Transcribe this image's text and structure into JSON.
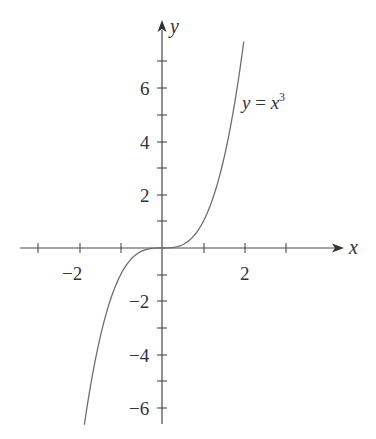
{
  "chart_data": {
    "type": "line",
    "title": "",
    "xlabel": "x",
    "ylabel": "y",
    "function": "y = x^3",
    "series": [
      {
        "name": "y = x^3",
        "x": [
          -1.88,
          -1.5,
          -1.0,
          -0.5,
          0,
          0.5,
          1.0,
          1.5,
          1.98
        ],
        "values": [
          -6.64,
          -3.375,
          -1.0,
          -0.125,
          0,
          0.125,
          1.0,
          3.375,
          7.76
        ]
      }
    ],
    "annotation": {
      "text_y": "y",
      "text_eq": " = ",
      "text_x": "x",
      "text_exp": "3"
    },
    "xticks": [
      -3,
      -2,
      -1,
      0,
      1,
      2,
      3
    ],
    "xtick_labels": [
      {
        "value": -2,
        "label": "−2"
      },
      {
        "value": 2,
        "label": "2"
      }
    ],
    "yticks": [
      -6,
      -5,
      -4,
      -3,
      -2,
      -1,
      1,
      2,
      3,
      4,
      5,
      6,
      7
    ],
    "ytick_labels": [
      {
        "value": 6,
        "label": "6"
      },
      {
        "value": 4,
        "label": "4"
      },
      {
        "value": 2,
        "label": "2"
      },
      {
        "value": -2,
        "label": "−2"
      },
      {
        "value": -4,
        "label": "−4"
      },
      {
        "value": -6,
        "label": "−6"
      }
    ],
    "xlim": [
      -3.4,
      4.4
    ],
    "ylim": [
      -6.6,
      8.6
    ],
    "grid": false,
    "legend": "none"
  },
  "labels": {
    "x_axis": "x",
    "y_axis": "y",
    "eq_y": "y",
    "eq_mid": " = ",
    "eq_x": "x",
    "eq_exp": "3",
    "xt_m2": "−2",
    "xt_2": "2",
    "yt_6": "6",
    "yt_4": "4",
    "yt_2": "2",
    "yt_m2": "−2",
    "yt_m4": "−4",
    "yt_m6": "−6"
  }
}
